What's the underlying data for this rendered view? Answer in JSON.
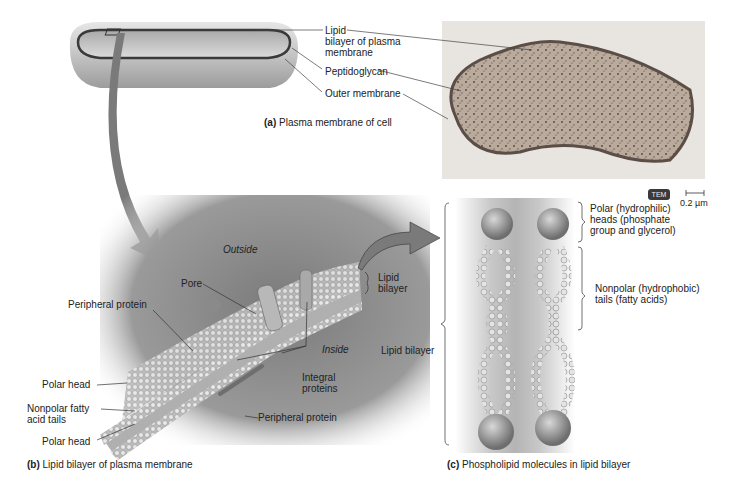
{
  "panel_a": {
    "caption_letter": "(a)",
    "caption_text": "Plasma membrane of cell",
    "labels": {
      "lipid_bilayer_line1": "Lipid",
      "lipid_bilayer_line2": "bilayer of plasma",
      "lipid_bilayer_line3": "membrane",
      "peptidoglycan": "Peptidoglycan",
      "outer_membrane": "Outer membrane"
    },
    "micrograph": {
      "badge": "TEM",
      "scale_bar": "0.2 µm"
    }
  },
  "panel_b": {
    "caption_letter": "(b)",
    "caption_text": "Lipid bilayer of plasma membrane",
    "labels": {
      "outside": "Outside",
      "inside": "Inside",
      "pore": "Pore",
      "peripheral_protein_top": "Peripheral protein",
      "peripheral_protein_bottom": "Peripheral protein",
      "integral_proteins_line1": "Integral",
      "integral_proteins_line2": "proteins",
      "polar_head_top": "Polar head",
      "nonpolar_line1": "Nonpolar fatty",
      "nonpolar_line2": "acid tails",
      "polar_head_bottom": "Polar head",
      "lipid_bilayer_line1": "Lipid",
      "lipid_bilayer_line2": "bilayer"
    }
  },
  "panel_c": {
    "caption_letter": "(c)",
    "caption_text": "Phospholipid molecules in lipid bilayer",
    "labels": {
      "lipid_bilayer": "Lipid bilayer",
      "polar_line1": "Polar (hydrophilic)",
      "polar_line2": "heads (phosphate",
      "polar_line3": "group and glycerol)",
      "nonpolar_line1": "Nonpolar (hydrophobic)",
      "nonpolar_line2": "tails (fatty acids)"
    }
  },
  "colors": {
    "cell_body": "#b9b9b9",
    "membrane_line": "#3a3a3a",
    "arrow": "#7a7a7a",
    "background_panel": "#7d7d7d",
    "head_sphere": "#9a9a9a"
  }
}
